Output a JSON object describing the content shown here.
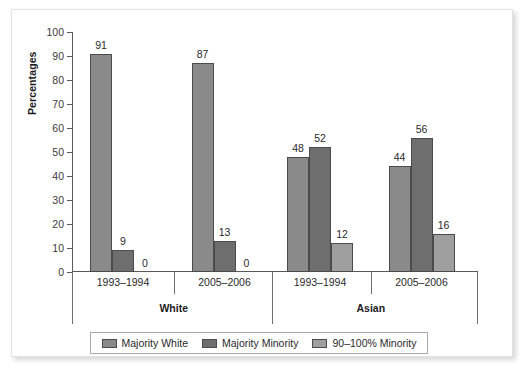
{
  "chart_data": {
    "type": "bar",
    "title": "",
    "subtitle": "",
    "xlabel": "",
    "ylabel": "Percentages",
    "ylim": [
      0,
      100
    ],
    "ytick_step": 10,
    "yticks": [
      0,
      10,
      20,
      30,
      40,
      50,
      60,
      70,
      80,
      90,
      100
    ],
    "grid": false,
    "legend_position": "bottom",
    "series": [
      {
        "name": "Majority White",
        "color": "#8a8a8a",
        "values": [
          91,
          87,
          48,
          44
        ]
      },
      {
        "name": "Majority Minority",
        "color": "#6e6e6e",
        "values": [
          9,
          13,
          52,
          56
        ]
      },
      {
        "name": "90–100% Minority",
        "color": "#9f9f9f",
        "values": [
          0,
          0,
          12,
          16
        ]
      }
    ],
    "categories": [
      "1993–1994",
      "2005–2006",
      "1993–1994",
      "2005–2006"
    ],
    "super_groups": [
      {
        "label": "White",
        "categories": [
          "1993–1994",
          "2005–2006"
        ]
      },
      {
        "label": "Asian",
        "categories": [
          "1993–1994",
          "2005–2006"
        ]
      }
    ],
    "bar_labels": [
      [
        "91",
        "9",
        "0"
      ],
      [
        "87",
        "13",
        "0"
      ],
      [
        "48",
        "52",
        "12"
      ],
      [
        "44",
        "56",
        "16"
      ]
    ]
  },
  "axis": {
    "y_title": "Percentages",
    "tick_labels": [
      "100",
      "90",
      "80",
      "70",
      "60",
      "50",
      "40",
      "30",
      "20",
      "10",
      "0"
    ]
  },
  "legend": {
    "items": [
      {
        "label": "Majority White"
      },
      {
        "label": "Majority Minority"
      },
      {
        "label": "90–100% Minority"
      }
    ]
  },
  "groups": [
    {
      "sub": "1993–1994"
    },
    {
      "sub": "2005–2006"
    },
    {
      "sub": "1993–1994"
    },
    {
      "sub": "2005–2006"
    }
  ],
  "group_titles": [
    {
      "label": "White"
    },
    {
      "label": "Asian"
    }
  ]
}
